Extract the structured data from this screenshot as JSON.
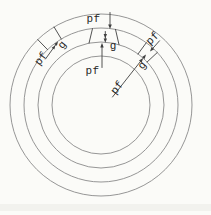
{
  "figure": {
    "type": "diagram",
    "background_color": "#fbfbf8",
    "ring_color": "#8a8a8a",
    "annotation_color": "#3f3f3f",
    "text_color": "#262626",
    "scan_smudge_color": "#ebebe6",
    "ring_count": 4,
    "labels": {
      "top_outer_pf": "pf",
      "top_gap_g": "g",
      "top_inner_pf": "pf",
      "upper_left_pf": "pf",
      "upper_left_g": "g",
      "upper_right_pf": "pf",
      "mid_right_g": "g",
      "mid_right_pf": "pf"
    }
  }
}
